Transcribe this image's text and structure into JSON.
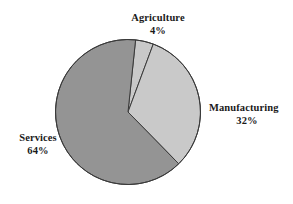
{
  "chart_data": {
    "type": "pie",
    "title": "",
    "subtitle": "",
    "xlabel": "",
    "ylabel": "",
    "grid": false,
    "legend_position": "none",
    "label_style": "outside-callout-text",
    "start_angle_deg": -84,
    "direction": "clockwise",
    "units": "percent",
    "total": 100,
    "categories": [
      "Agriculture",
      "Manufacturing",
      "Services"
    ],
    "values": [
      4,
      32,
      64
    ],
    "slices": [
      {
        "name": "Agriculture",
        "value": 4,
        "value_label": "4%",
        "color": "#c9c9c9",
        "stroke": "#3a3a3a"
      },
      {
        "name": "Manufacturing",
        "value": 32,
        "value_label": "32%",
        "color": "#c9c9c9",
        "stroke": "#3a3a3a"
      },
      {
        "name": "Services",
        "value": 64,
        "value_label": "64%",
        "color": "#949494",
        "stroke": "#3a3a3a"
      }
    ]
  },
  "labels": {
    "agriculture": {
      "name": "Agriculture",
      "value": "4%"
    },
    "manufacturing": {
      "name": "Manufacturing",
      "value": "32%"
    },
    "services": {
      "name": "Services",
      "value": "64%"
    }
  },
  "colors": {
    "background": "#ffffff",
    "text": "#1a1a1a",
    "outline": "#3a3a3a",
    "services_fill": "#949494",
    "manufacturing_fill": "#c9c9c9",
    "agriculture_fill": "#c9c9c9"
  },
  "geometry": {
    "center_x": 128,
    "center_y": 112,
    "radius": 72.5
  }
}
